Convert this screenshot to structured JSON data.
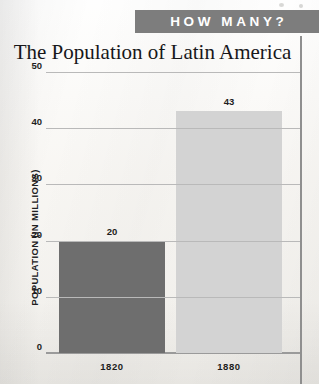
{
  "banner": {
    "label": "HOW MANY?",
    "background_color": "#7d7d7d",
    "text_color": "#ffffff"
  },
  "chart_data": {
    "type": "bar",
    "title": "The Population of Latin America",
    "xlabel": "",
    "ylabel": "POPULATION (IN MILLIONS)",
    "categories": [
      "1820",
      "1880"
    ],
    "values": [
      20,
      43
    ],
    "value_labels": [
      "20",
      "43"
    ],
    "series": [
      {
        "name": "Population of Latin America",
        "values": [
          20,
          43
        ]
      }
    ],
    "ylim": [
      0,
      50
    ],
    "yticks": [
      0,
      10,
      20,
      30,
      40,
      50
    ],
    "ytick_labels": [
      "0",
      "10",
      "20",
      "30",
      "40",
      "50"
    ],
    "grid": true,
    "legend": "none",
    "bar_colors": [
      "#6e6e6e",
      "#d3d3d3"
    ],
    "gridline_color": "#b9b9b9"
  }
}
